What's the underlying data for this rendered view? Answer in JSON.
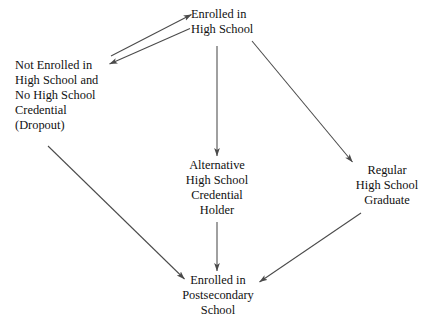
{
  "diagram": {
    "background_color": "#ffffff",
    "text_color": "#111111",
    "arrow_color": "#4a4a4a",
    "nodes": [
      {
        "id": "enrolled-high-school",
        "name": "Enrolled in High School",
        "lines": [
          "Enrolled in",
          "High School"
        ]
      },
      {
        "id": "dropout",
        "name": "Not Enrolled in High School and No High School Credential (Dropout)",
        "lines": [
          "Not Enrolled in",
          "High School and",
          "No High School",
          "Credential",
          "(Dropout)"
        ]
      },
      {
        "id": "alternative-credential",
        "name": "Alternative High School Credential Holder",
        "lines": [
          "Alternative",
          "High School",
          "Credential",
          "Holder"
        ]
      },
      {
        "id": "regular-graduate",
        "name": "Regular High School Graduate",
        "lines": [
          "Regular",
          "High School",
          "Graduate"
        ]
      },
      {
        "id": "postsecondary",
        "name": "Enrolled in Postsecondary School",
        "lines": [
          "Enrolled in",
          "Postsecondary",
          "School"
        ]
      }
    ],
    "edges": [
      {
        "id": "dropout-to-enrolled",
        "from": "dropout",
        "to": "enrolled-high-school",
        "direction": "forward",
        "label": "Dropout re-enrolls in high school"
      },
      {
        "id": "enrolled-to-dropout",
        "from": "enrolled-high-school",
        "to": "dropout",
        "direction": "forward",
        "label": "Enrolled student drops out"
      },
      {
        "id": "enrolled-to-alternative",
        "from": "enrolled-high-school",
        "to": "alternative-credential",
        "direction": "forward",
        "label": "Earns alternative credential"
      },
      {
        "id": "enrolled-to-regular",
        "from": "enrolled-high-school",
        "to": "regular-graduate",
        "direction": "forward",
        "label": "Graduates regular high school"
      },
      {
        "id": "dropout-to-postsecondary",
        "from": "dropout",
        "to": "postsecondary",
        "direction": "forward",
        "label": "Dropout enters postsecondary"
      },
      {
        "id": "alternative-to-postsecondary",
        "from": "alternative-credential",
        "to": "postsecondary",
        "direction": "forward",
        "label": "Alternative credential holder enters postsecondary"
      },
      {
        "id": "regular-to-postsecondary",
        "from": "regular-graduate",
        "to": "postsecondary",
        "direction": "forward",
        "label": "Graduate enters postsecondary"
      }
    ]
  }
}
